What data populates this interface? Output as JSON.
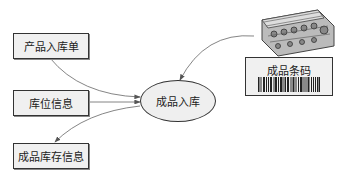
{
  "diagram": {
    "inputs": [
      {
        "label": "产品入库单"
      },
      {
        "label": "库位信息"
      }
    ],
    "output": {
      "label": "成品库存信息"
    },
    "process": {
      "label": "成品入库"
    },
    "barcode": {
      "label": "成品条码",
      "icon": "engine-block-image"
    }
  },
  "colors": {
    "box_fill": "#f0f0f0",
    "border": "#333333",
    "arrow": "#555555"
  }
}
